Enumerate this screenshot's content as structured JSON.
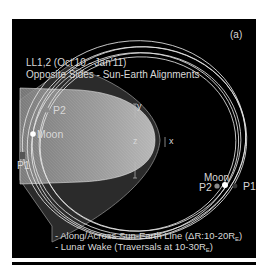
{
  "panel_label": "(a)",
  "title": {
    "line1": "LL1,2 (Oct'10 - Jan'11)",
    "line2": "Opposite Sides - Sun-Earth Alignments"
  },
  "axes": {
    "x": "x",
    "y": "y",
    "z": "z"
  },
  "markers_left": {
    "p2": "P2",
    "moon": "Moon",
    "p1": "P1"
  },
  "markers_right": {
    "moon": "Moon",
    "p2": "P2",
    "p1": "P1"
  },
  "notes": {
    "line1_prefix": "- Along/Across Sun-Earth Line (ΔR:10-20R",
    "line1_sub": "E",
    "line1_suffix": ")",
    "line2_prefix": "- Lunar Wake (Traversals at 10-30R",
    "line2_sub": "E",
    "line2_suffix": ")"
  },
  "colors": {
    "background": "#000000",
    "text": "#d8d8d8",
    "orbit": "#e6e6e6",
    "magnetosphere": "#9a9a9a",
    "shell": "#3a3a3a"
  }
}
